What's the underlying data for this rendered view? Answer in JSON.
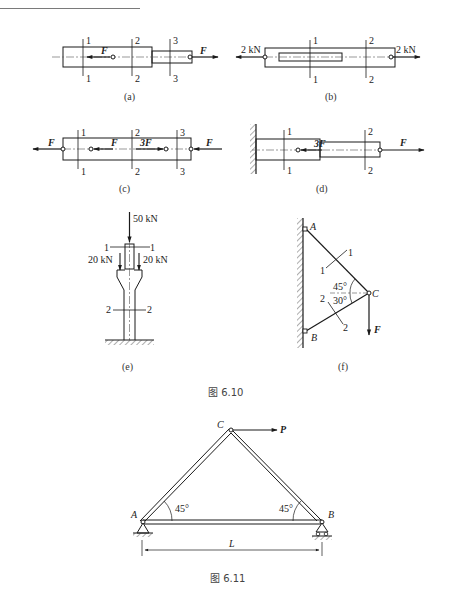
{
  "header": {
    "left_text": "",
    "right_text": ""
  },
  "figure_6_10": {
    "caption": "图 6.10",
    "a": {
      "label": "(a)",
      "sections": [
        "1",
        "2",
        "3"
      ],
      "forces": [
        "F",
        "F"
      ]
    },
    "b": {
      "label": "(b)",
      "sections": [
        "1",
        "2"
      ],
      "forces": [
        "2 kN",
        "2 kN"
      ]
    },
    "c": {
      "label": "(c)",
      "sections": [
        "1",
        "2",
        "3"
      ],
      "forces": [
        "F",
        "F",
        "3F",
        "F"
      ]
    },
    "d": {
      "label": "(d)",
      "sections": [
        "1",
        "2"
      ],
      "forces": [
        "3F",
        "F"
      ]
    },
    "e": {
      "label": "(e)",
      "sections": [
        "1",
        "2"
      ],
      "forces": [
        "50 kN",
        "20 kN",
        "20 kN"
      ]
    },
    "f": {
      "label": "(f)",
      "points": [
        "A",
        "B",
        "C"
      ],
      "sections": [
        "1",
        "2"
      ],
      "angles": [
        "45°",
        "30°"
      ],
      "force": "F"
    }
  },
  "figure_6_11": {
    "caption": "图 6.11",
    "points": [
      "A",
      "B",
      "C"
    ],
    "force": "P",
    "angles": [
      "45°",
      "45°"
    ],
    "span_label": "L"
  }
}
